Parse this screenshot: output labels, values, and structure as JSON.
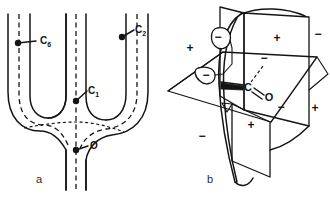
{
  "figure": {
    "panels": [
      {
        "letter": "a",
        "name": "tuning-fork-channel-diagram",
        "labels": [
          {
            "id": "c6",
            "base": "C",
            "sub": "6",
            "x": 40,
            "y": 40
          },
          {
            "id": "c2",
            "base": "C",
            "sub": "2",
            "x": 136,
            "y": 34
          },
          {
            "id": "c1",
            "base": "C",
            "sub": "1",
            "x": 88,
            "y": 94
          },
          {
            "id": "o",
            "base": "O",
            "sub": "",
            "x": 89,
            "y": 148
          }
        ],
        "points": [
          {
            "id": "c6-point",
            "x": 18,
            "y": 43
          },
          {
            "id": "c2-point",
            "x": 122,
            "y": 37
          },
          {
            "id": "c1-point",
            "x": 76,
            "y": 101
          },
          {
            "id": "o-point",
            "x": 76,
            "y": 150
          }
        ]
      },
      {
        "letter": "b",
        "name": "octant-rule-three-plane-diagram",
        "signs": [
          {
            "id": "sign-left-plus",
            "text": "+",
            "x": 25,
            "y": 48
          },
          {
            "id": "sign-upper-minus-lobe",
            "text": "−",
            "x": -1,
            "y": 0
          },
          {
            "id": "sign-dashed-minus",
            "text": "−",
            "x": 96,
            "y": 61
          },
          {
            "id": "sign-right-upper-plus",
            "text": "+",
            "x": 190,
            "y": 40
          },
          {
            "id": "sign-far-right-minus",
            "text": "−",
            "x": 282,
            "y": 35
          },
          {
            "id": "sign-mid-right-minus",
            "text": "−",
            "x": 181,
            "y": 112
          },
          {
            "id": "sign-far-right-plus",
            "text": "+",
            "x": 271,
            "y": 113
          },
          {
            "id": "sign-center-plus",
            "text": "+",
            "x": 86,
            "y": 128
          },
          {
            "id": "sign-lower-left-minus",
            "text": "−",
            "x": 34,
            "y": 148
          }
        ],
        "atoms": [
          {
            "id": "carbon-atom",
            "text": "C",
            "x": 83,
            "y": 87
          },
          {
            "id": "oxygen-atom",
            "text": "O",
            "x": 101,
            "y": 97
          }
        ],
        "lobe_signs": [
          {
            "id": "lobe-upper-minus",
            "text": "−",
            "x": 53,
            "y": 37
          },
          {
            "id": "lobe-lower-minus",
            "text": "−",
            "x": 42,
            "y": 75
          }
        ]
      }
    ]
  },
  "colors": {
    "ink": "#141414",
    "background": "#ffffff"
  }
}
